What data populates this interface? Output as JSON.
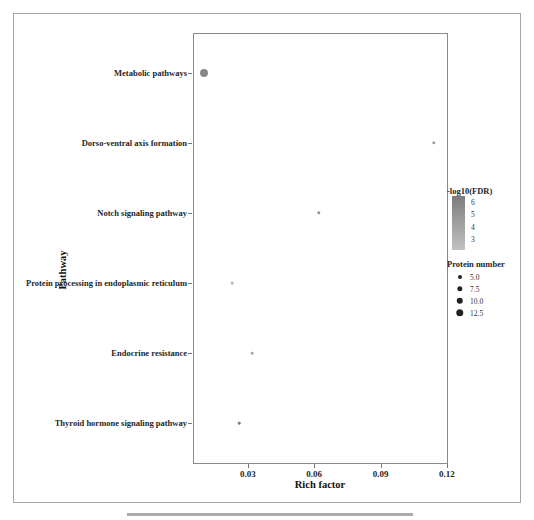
{
  "chart_data": {
    "type": "scatter",
    "title": "",
    "xlabel": "Rich factor",
    "ylabel": "Pathway",
    "xlim": [
      0.0052,
      0.1205
    ],
    "x_ticks": [
      0.03,
      0.06,
      0.09,
      0.12
    ],
    "x_tick_labels": [
      "0.03",
      "0.06",
      "0.09",
      "0.12"
    ],
    "grid": false,
    "points": [
      {
        "pathway": "Metabolic pathways",
        "rich_factor": 0.01,
        "protein_number": 14,
        "neg_log10_fdr": 5.5
      },
      {
        "pathway": "Dorso-ventral axis formation",
        "rich_factor": 0.114,
        "protein_number": 4,
        "neg_log10_fdr": 4.5
      },
      {
        "pathway": "Notch signaling pathway",
        "rich_factor": 0.062,
        "protein_number": 4,
        "neg_log10_fdr": 5.0
      },
      {
        "pathway": "Protein processing in endoplasmic reticulum",
        "rich_factor": 0.023,
        "protein_number": 3,
        "neg_log10_fdr": 3.5
      },
      {
        "pathway": "Endocrine resistance",
        "rich_factor": 0.032,
        "protein_number": 3,
        "neg_log10_fdr": 4.0
      },
      {
        "pathway": "Thyroid hormone signaling pathway",
        "rich_factor": 0.026,
        "protein_number": 3,
        "neg_log10_fdr": 6.0
      }
    ],
    "legend": {
      "color": {
        "title": "-log10(FDR)",
        "tick_labels": [
          "6",
          "5",
          "4",
          "3"
        ],
        "gradient_top": "#7c7c7c",
        "gradient_bottom": "#c2c2c2",
        "position": "right"
      },
      "size": {
        "title": "Protein number",
        "entries": [
          {
            "label": "5.0",
            "value": 5.0
          },
          {
            "label": "7.5",
            "value": 7.5
          },
          {
            "label": "10.0",
            "value": 10.0
          },
          {
            "label": "12.5",
            "value": 12.5
          }
        ]
      }
    }
  }
}
